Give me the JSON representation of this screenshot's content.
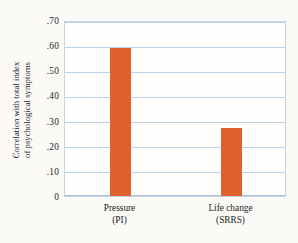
{
  "chart_data": {
    "type": "bar",
    "title": "",
    "subtitle": "",
    "xlabel": "",
    "ylabel": "Correlation with total index of psychological symptoms",
    "ylabel_lines": [
      "Correlation with total index",
      "of psychological symptoms"
    ],
    "categories": [
      "Pressure (PI)",
      "Life change (SRRS)"
    ],
    "category_lines": [
      [
        "Pressure",
        "(PI)"
      ],
      [
        "Life change",
        "(SRRS)"
      ]
    ],
    "values": [
      0.59,
      0.27
    ],
    "ylim": [
      0,
      0.7
    ],
    "ytick_values": [
      0.7,
      0.6,
      0.5,
      0.4,
      0.3,
      0.2,
      0.1,
      0
    ],
    "ytick_labels": [
      ".70",
      ".60",
      ".50",
      ".40",
      ".30",
      ".20",
      ".10",
      "0"
    ],
    "grid": true,
    "legend": "none",
    "bar_color": "#e1602c",
    "gridline_color": "#b9d2e8",
    "frame_color": "#c3d4e4",
    "background_color": "#fbfaf7",
    "plot_background_color": "#fffefc",
    "text_color": "#1b1b1b"
  }
}
